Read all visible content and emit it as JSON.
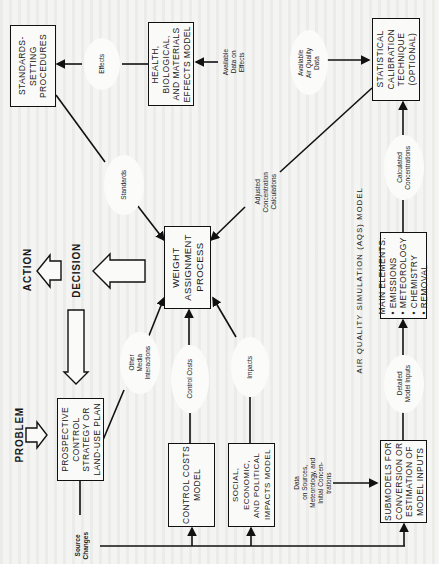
{
  "diagram": {
    "title": "AIR QUALITY SIMULATION (AQS) MODEL",
    "orientation": "rotated-90-ccw",
    "stages": {
      "problem": "PROBLEM",
      "decision": "DECISION",
      "action": "ACTION"
    },
    "boxes": {
      "standards_setting": "STANDARDS-\nSETTING\nPROCEDURES",
      "health_effects": "HEALTH,\nBIOLOGICAL,\nAND MATERIALS\nEFFECTS MODEL",
      "statistical_calibration": "STATISTICAL\nCALIBRATION\nTECHNIQUE\n(Optional)",
      "weight_assignment": "WEIGHT\nASSIGNMENT\nPROCESS",
      "prospective_control": "PROSPECTIVE\nCONTROL\nSTRATEGY OR\nLAND-USE PLAN",
      "control_costs": "CONTROL COSTS\nMODEL",
      "social_impacts": "SOCIAL, ECONOMIC,\nAND POLITICAL\nIMPACTS MODEL",
      "submodels": "SUBMODELS FOR\nCONVERSION OR\nESTIMATION OF\nMODEL INPUTS",
      "main_elements": {
        "heading": "MAIN ELEMENTS:",
        "items": [
          "EMISSIONS",
          "METEOROLOGY",
          "CHEMISTRY",
          "REMOVAL"
        ]
      }
    },
    "flow_labels": {
      "effects": "Effects",
      "standards": "Standards",
      "available_data_on_effects": "Available\nData on\nEffects",
      "available_air_quality_data": "Available\nAir Quality\nData",
      "adjusted_concentration_calculations": "Adjusted\nConcentration\nCalculations",
      "other_media_interactions": "Other\nMedia\nInteractions",
      "control_costs": "Control Costs",
      "impacts": "Impacts",
      "calculated_concentrations": "Calculated\nConcentrations",
      "detailed_model_inputs": "Detailed\nModel Inputs",
      "data_on_sources": "Data\non Sources,\nMeteorology, and\nInitial Concen-\ntrations",
      "source_changes": "Source\nChanges"
    },
    "colors": {
      "ink": "#111111",
      "paper": "#f4f4f2"
    }
  }
}
